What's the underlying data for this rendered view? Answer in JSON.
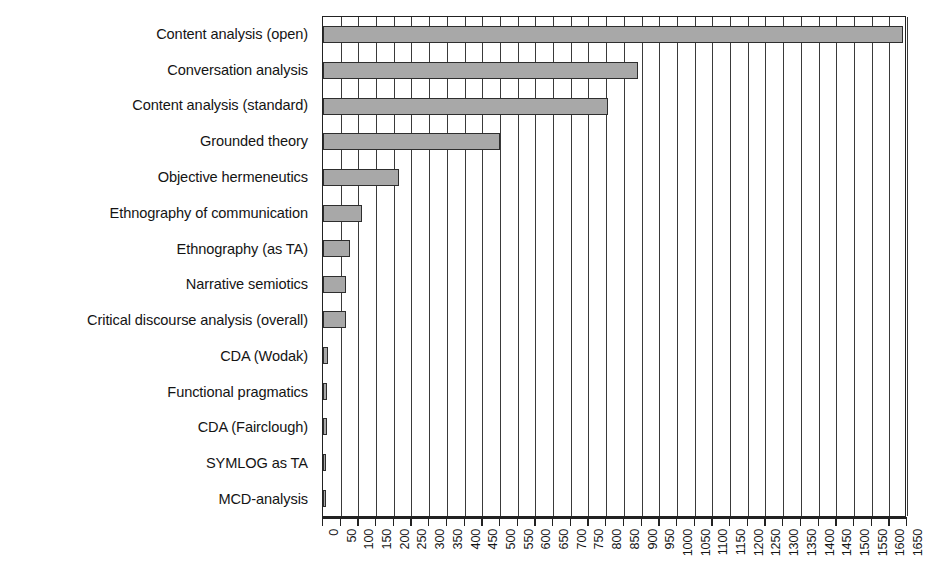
{
  "chart_data": {
    "type": "bar",
    "orientation": "horizontal",
    "title": "",
    "xlabel": "",
    "ylabel": "",
    "xlim": [
      0,
      1650
    ],
    "xtick_step": 50,
    "grid": true,
    "legend": "none",
    "bar_color": "#a8a8a8",
    "bar_border_color": "#2e2e2e",
    "categories": [
      "Content analysis (open)",
      "Conversation analysis",
      "Content analysis (standard)",
      "Grounded theory",
      "Objective hermeneutics",
      "Ethnography of communication",
      "Ethnography (as TA)",
      "Narrative semiotics",
      "Critical discourse analysis (overall)",
      "CDA (Wodak)",
      "Functional pragmatics",
      "CDA (Fairclough)",
      "SYMLOG as TA",
      "MCD-analysis"
    ],
    "values": [
      1640,
      890,
      805,
      500,
      215,
      110,
      75,
      65,
      65,
      15,
      12,
      10,
      8,
      6
    ],
    "xticks": [
      "0",
      "50",
      "100",
      "150",
      "200",
      "250",
      "300",
      "350",
      "400",
      "450",
      "500",
      "550",
      "600",
      "650",
      "700",
      "750",
      "800",
      "850",
      "900",
      "950",
      "1000",
      "1050",
      "1100",
      "1150",
      "1200",
      "1250",
      "1300",
      "1350",
      "1400",
      "1450",
      "1500",
      "1550",
      "1600",
      "1650"
    ]
  }
}
